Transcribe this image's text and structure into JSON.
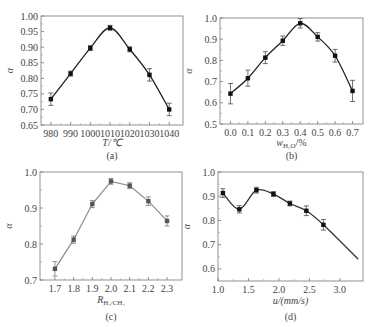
{
  "chart_data": [
    {
      "id": "a",
      "type": "line",
      "caption": "(a)",
      "xlabel": "T/℃",
      "ylabel": "α",
      "x": [
        980,
        990,
        1000,
        1010,
        1020,
        1030,
        1040
      ],
      "x_ticks": [
        "980",
        "990",
        "1000",
        "1010",
        "1020",
        "1030",
        "1040"
      ],
      "values": [
        0.733,
        0.815,
        0.897,
        0.962,
        0.893,
        0.811,
        0.7
      ],
      "errors": [
        0.02,
        0.008,
        0.008,
        0.008,
        0.008,
        0.02,
        0.02
      ],
      "xlim": [
        975,
        1047
      ],
      "ylim": [
        0.65,
        1.0
      ],
      "y_ticks": [
        "0.65",
        "0.70",
        "0.75",
        "0.80",
        "0.85",
        "0.90",
        "0.95",
        "1.00"
      ],
      "line_color": "#222222",
      "smooth": true
    },
    {
      "id": "b",
      "type": "line",
      "caption": "(b)",
      "xlabel": "wH2O/%",
      "ylabel": "α",
      "x": [
        0.0,
        0.1,
        0.2,
        0.3,
        0.4,
        0.5,
        0.6,
        0.7
      ],
      "x_ticks": [
        "0.0",
        "0.1",
        "0.2",
        "0.3",
        "0.4",
        "0.5",
        "0.6",
        "0.7"
      ],
      "values": [
        0.643,
        0.716,
        0.813,
        0.893,
        0.975,
        0.911,
        0.822,
        0.656
      ],
      "errors": [
        0.048,
        0.038,
        0.028,
        0.022,
        0.022,
        0.02,
        0.03,
        0.05
      ],
      "xlim": [
        -0.06,
        0.76
      ],
      "ylim": [
        0.5,
        1.0
      ],
      "y_ticks": [
        "0.5",
        "0.6",
        "0.7",
        "0.8",
        "0.9",
        "1.0"
      ],
      "line_color": "#222222",
      "smooth": true
    },
    {
      "id": "c",
      "type": "line",
      "caption": "(c)",
      "xlabel": "RH2/CH4",
      "ylabel": "α",
      "x": [
        1.7,
        1.8,
        1.9,
        2.0,
        2.1,
        2.2,
        2.3
      ],
      "x_ticks": [
        "1.7",
        "1.8",
        "1.9",
        "2.0",
        "2.1",
        "2.2",
        "2.3"
      ],
      "values": [
        0.731,
        0.812,
        0.911,
        0.974,
        0.962,
        0.919,
        0.864
      ],
      "errors": [
        0.02,
        0.01,
        0.01,
        0.008,
        0.008,
        0.012,
        0.014
      ],
      "xlim": [
        1.62,
        2.38
      ],
      "ylim": [
        0.7,
        1.0
      ],
      "y_ticks": [
        "0.7",
        "0.8",
        "0.9",
        "1.0"
      ],
      "line_color": "#8a8a8a",
      "smooth": false
    },
    {
      "id": "d",
      "type": "line",
      "caption": "(d)",
      "xlabel": "u/(mm/s)",
      "ylabel": "α",
      "x": [
        1.08,
        1.35,
        1.63,
        1.91,
        2.18,
        2.45,
        2.73
      ],
      "x_ticks": [
        "1.0",
        "1.5",
        "2.0",
        "2.5",
        "3.0"
      ],
      "values": [
        0.913,
        0.846,
        0.925,
        0.909,
        0.87,
        0.84,
        0.782
      ],
      "errors": [
        0.018,
        0.015,
        0.012,
        0.01,
        0.01,
        0.02,
        0.022
      ],
      "curve_extends_to": [
        3.3,
        0.64
      ],
      "xlim": [
        1.0,
        3.38
      ],
      "ylim": [
        0.55,
        1.0
      ],
      "y_ticks": [
        "0.6",
        "0.7",
        "0.8",
        "0.9",
        "1.0"
      ],
      "line_color": "#333333",
      "smooth": true
    }
  ]
}
